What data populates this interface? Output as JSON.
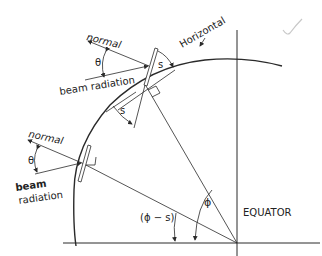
{
  "diagram": {
    "labels": {
      "normal_upper": "normal",
      "theta_upper": "θ",
      "beam_radiation_upper": "beam radiation",
      "horizontal": "Horizontal",
      "s_upper": "s",
      "s_lower": "s",
      "normal_lower": "normal",
      "theta_lower": "θ",
      "beam_lower": "beam",
      "radiation_lower": "radiation",
      "phi_minus_s": "(ϕ − s)",
      "phi": "ϕ",
      "equator": "EQUATOR"
    },
    "colors": {
      "line": "#2a2a2a",
      "background": "#ffffff",
      "checkmark": "#c8c8c8"
    }
  }
}
